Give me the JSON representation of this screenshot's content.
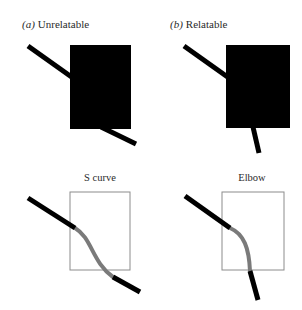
{
  "figure": {
    "background_color": "#ffffff",
    "occluder_color": "#000000",
    "line_color": "#000000",
    "interpolated_color": "#7a7a7a",
    "box_outline_color": "#8c8c8c",
    "text_color": "#2a2a2a"
  },
  "panels": {
    "top_left": {
      "index": "(a)",
      "label": "Unrelatable",
      "occluder": {
        "x": 70,
        "y": 45,
        "width": 61,
        "height": 84
      },
      "segments": [
        {
          "name": "upper-left-segment",
          "x1": 28,
          "y1": 46,
          "x2": 73,
          "y2": 78,
          "width": 5
        },
        {
          "name": "lower-right-segment",
          "x1": 101,
          "y1": 127,
          "x2": 136,
          "y2": 144,
          "width": 5
        }
      ]
    },
    "top_right": {
      "index": "(b)",
      "label": "Relatable",
      "occluder": {
        "x": 226,
        "y": 45,
        "width": 64,
        "height": 83
      },
      "segments": [
        {
          "name": "upper-left-segment",
          "x1": 184,
          "y1": 46,
          "x2": 229,
          "y2": 78,
          "width": 5
        },
        {
          "name": "lower-vertical-segment",
          "x1": 253,
          "y1": 127,
          "x2": 259,
          "y2": 153,
          "width": 5
        }
      ]
    },
    "bottom_left": {
      "title": "S curve",
      "box": {
        "x": 70,
        "y": 192,
        "width": 60,
        "height": 78
      },
      "visible_segments": [
        {
          "name": "upper-left-segment",
          "x1": 28,
          "y1": 198,
          "x2": 75,
          "y2": 228,
          "width": 5
        },
        {
          "name": "lower-right-segment",
          "x1": 113,
          "y1": 277,
          "x2": 140,
          "y2": 292,
          "width": 5
        }
      ],
      "interpolation": {
        "name": "s-curve-completion",
        "path": "M 75 228 C 92 238, 92 262, 113 277",
        "width": 4
      }
    },
    "bottom_right": {
      "title": "Elbow",
      "box": {
        "x": 222,
        "y": 192,
        "width": 62,
        "height": 78
      },
      "visible_segments": [
        {
          "name": "upper-left-segment",
          "x1": 185,
          "y1": 196,
          "x2": 230,
          "y2": 228,
          "width": 5
        },
        {
          "name": "lower-vertical-segment",
          "x1": 250,
          "y1": 271,
          "x2": 258,
          "y2": 300,
          "width": 5
        }
      ],
      "interpolation": {
        "name": "elbow-completion",
        "path": "M 230 228 C 244 234, 249 248, 250 271",
        "width": 4
      }
    }
  }
}
